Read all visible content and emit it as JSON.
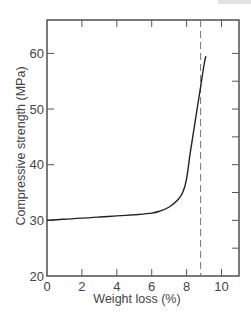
{
  "chart_data": {
    "type": "line",
    "title": "",
    "xlabel": "Weight loss (%)",
    "ylabel": "Compressive strength (MPa)",
    "xlim": [
      0,
      11
    ],
    "ylim": [
      20,
      66
    ],
    "xticks": [
      0,
      2,
      4,
      6,
      8,
      10
    ],
    "yticks": [
      20,
      30,
      40,
      50,
      60
    ],
    "xtick_labels": [
      "0",
      "2",
      "4",
      "6",
      "8",
      "10"
    ],
    "ytick_labels": [
      "20",
      "30",
      "40",
      "50",
      "60"
    ],
    "grid": false,
    "legend": null,
    "series": [
      {
        "name": "Compressive strength",
        "style": "solid",
        "x": [
          0,
          1,
          2,
          3,
          4,
          5,
          6,
          6.5,
          7,
          7.5,
          7.8,
          8.0,
          8.2,
          8.4,
          8.6,
          8.8,
          9.0,
          9.1
        ],
        "y": [
          30.0,
          30.2,
          30.4,
          30.6,
          30.8,
          31.0,
          31.3,
          31.7,
          32.4,
          33.7,
          35.2,
          37.5,
          42.0,
          46.0,
          50.0,
          54.0,
          58.0,
          59.5
        ]
      }
    ],
    "annotations": [
      {
        "type": "vertical_dashed_line",
        "x": 8.8
      }
    ]
  }
}
